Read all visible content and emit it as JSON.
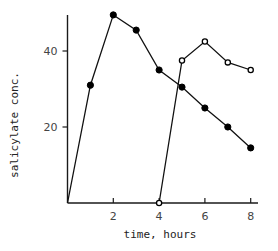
{
  "chart_data": {
    "type": "line",
    "title": "",
    "xlabel": "time, hours",
    "ylabel": "salicylate conc.",
    "xlim": [
      0,
      8.3
    ],
    "ylim": [
      0,
      52
    ],
    "xticks": [
      2,
      4,
      6,
      8
    ],
    "yticks": [
      20,
      40
    ],
    "grid": false,
    "legend": null,
    "series": [
      {
        "name": "first dose",
        "marker": "filled-circle",
        "x": [
          0,
          1,
          2,
          3,
          4,
          5,
          6,
          7,
          8
        ],
        "y": [
          0,
          31,
          49.5,
          45.5,
          35,
          30.5,
          25,
          20,
          14.5
        ],
        "marker_indices": [
          1,
          2,
          3,
          4,
          5,
          6,
          7,
          8
        ]
      },
      {
        "name": "second dose",
        "marker": "open-circle",
        "x": [
          4,
          5,
          6,
          7,
          8
        ],
        "y": [
          0,
          37.5,
          42.5,
          37,
          35
        ],
        "marker_indices": [
          0,
          1,
          2,
          3,
          4
        ]
      }
    ]
  }
}
